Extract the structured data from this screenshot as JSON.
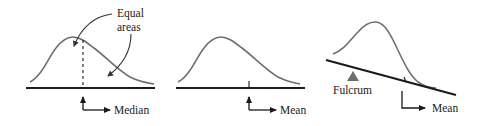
{
  "figure": {
    "panels": [
      {
        "id": "median",
        "callout_line1": "Equal",
        "callout_line2": "areas",
        "pointer_label": "Median"
      },
      {
        "id": "mean",
        "pointer_label": "Mean"
      },
      {
        "id": "balance",
        "fulcrum_label": "Fulcrum",
        "pointer_label": "Mean"
      }
    ],
    "colors": {
      "curve": "#6e6e6e",
      "axis": "#1a1a1a",
      "fulcrum": "#6e6e6e",
      "background": "#ffffff"
    }
  }
}
